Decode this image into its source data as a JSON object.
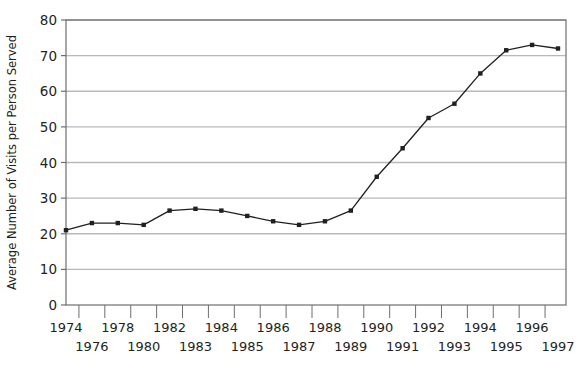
{
  "chart_data": {
    "type": "line",
    "title": "",
    "xlabel": "",
    "ylabel": "Average Number of Visits per Person Served",
    "ylim": [
      0,
      80
    ],
    "ytick_values": [
      0,
      10,
      20,
      30,
      40,
      50,
      60,
      70,
      80
    ],
    "ytick_labels": [
      "0",
      "10",
      "20",
      "30",
      "40",
      "50",
      "60",
      "70",
      "80"
    ],
    "grid": true,
    "grid_axis": "y",
    "legend": "none",
    "marker": "square-dot",
    "line_color": "#231f20",
    "grid_color": "#b8b8b8",
    "axis_color": "#6d6e71",
    "x": [
      1974,
      1975,
      1976,
      1977,
      1978,
      1979,
      1980,
      1981,
      1982,
      1983,
      1984,
      1985,
      1986,
      1987,
      1988,
      1989,
      1990,
      1991,
      1992,
      1993
    ],
    "values": [
      21,
      23,
      23,
      22.5,
      26.5,
      27,
      26.5,
      25,
      23.5,
      22.5,
      23.5,
      26.5,
      36,
      44,
      52.5,
      56.5,
      65,
      71.5,
      73,
      72
    ],
    "xtick_labels_upper": [
      "1974",
      "1978",
      "1982",
      "1984",
      "1986",
      "1988",
      "1990",
      "1992",
      "1994",
      "1996"
    ],
    "xtick_labels_lower": [
      "1976",
      "1980",
      "1983",
      "1985",
      "1987",
      "1989",
      "1991",
      "1993",
      "1995",
      "1997"
    ],
    "xtick_labels_all": [
      "1974",
      "1976",
      "1978",
      "1980",
      "1982",
      "1983",
      "1984",
      "1985",
      "1986",
      "1987",
      "1988",
      "1989",
      "1990",
      "1991",
      "1992",
      "1993",
      "1994",
      "1995",
      "1996",
      "1997"
    ]
  }
}
